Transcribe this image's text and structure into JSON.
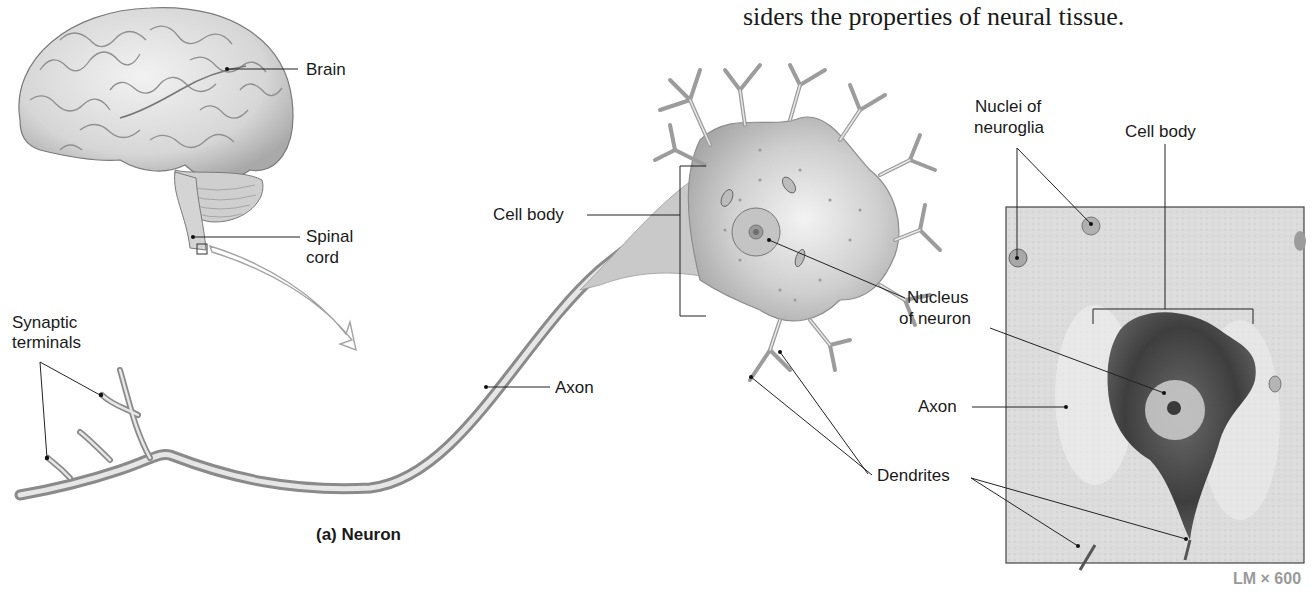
{
  "header": {
    "text_fragment": "siders the properties of neural tissue."
  },
  "brain_panel": {
    "labels": {
      "brain": "Brain",
      "spinal_cord_line1": "Spinal",
      "spinal_cord_line2": "cord"
    }
  },
  "neuron_panel": {
    "subtitle": "(a) Neuron",
    "labels": {
      "synaptic_terminals_line1": "Synaptic",
      "synaptic_terminals_line2": "terminals",
      "axon": "Axon",
      "cell_body": "Cell body",
      "nucleus_line1": "Nucleus",
      "nucleus_line2": "of neuron",
      "dendrites": "Dendrites"
    }
  },
  "micrograph_panel": {
    "labels": {
      "nuclei_line1": "Nuclei of",
      "nuclei_line2": "neuroglia",
      "cell_body": "Cell body",
      "axon": "Axon"
    },
    "magnification": "LM × 600"
  },
  "colors": {
    "text": "#1a1a1a",
    "leader_line": "#222222",
    "tissue_light": "#d9d9d9",
    "tissue_dark": "#4a4a4a",
    "micrograph_bg": "#dcdcdc",
    "magnification_text": "#9a9a9a"
  }
}
